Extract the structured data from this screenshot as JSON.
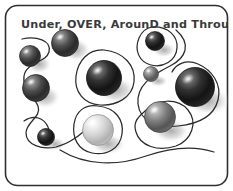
{
  "artwork": {
    "title": "Under, OVER, ArounD and Through",
    "frame": {
      "name": "rounded-rectangle-border",
      "stroke_color": "#2f2f2f",
      "fill_color": "#ffffff",
      "corner_radius": 12
    },
    "background_color": "#ffffff",
    "line_color": "#2b2b2b",
    "shadow_color": "#bfbfbf",
    "spheres": [
      {
        "id": "sphere-1",
        "cx": 30,
        "cy": 56,
        "r": 10.5,
        "tone": "dark",
        "highlight": "upper-left"
      },
      {
        "id": "sphere-2",
        "cx": 36,
        "cy": 88,
        "r": 13.5,
        "tone": "dark",
        "highlight": "upper-left"
      },
      {
        "id": "sphere-3",
        "cx": 46,
        "cy": 137,
        "r": 8.5,
        "tone": "darkest",
        "highlight": "upper-left"
      },
      {
        "id": "sphere-4",
        "cx": 65,
        "cy": 43,
        "r": 13.5,
        "tone": "dark",
        "highlight": "upper-left"
      },
      {
        "id": "sphere-5",
        "cx": 104,
        "cy": 78,
        "r": 17.5,
        "tone": "darkest",
        "highlight": "upper-left"
      },
      {
        "id": "sphere-6",
        "cx": 98,
        "cy": 130,
        "r": 15.5,
        "tone": "light",
        "highlight": "upper-left"
      },
      {
        "id": "sphere-7",
        "cx": 155,
        "cy": 41,
        "r": 9.5,
        "tone": "darkest",
        "highlight": "upper-left"
      },
      {
        "id": "sphere-8",
        "cx": 151,
        "cy": 74,
        "r": 7.5,
        "tone": "medium",
        "highlight": "upper-left"
      },
      {
        "id": "sphere-9",
        "cx": 195,
        "cy": 87,
        "r": 19.5,
        "tone": "darkest",
        "highlight": "upper-left"
      },
      {
        "id": "sphere-10",
        "cx": 160,
        "cy": 117,
        "r": 15.5,
        "tone": "medium",
        "highlight": "upper-left"
      }
    ],
    "sphere_count": 10,
    "curve_count": 5
  }
}
